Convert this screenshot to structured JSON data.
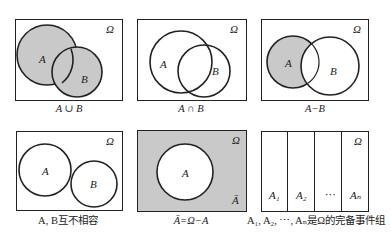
{
  "colors": {
    "fill": "#c9c9c9",
    "stroke": "#222222",
    "background": "#ffffff"
  },
  "panels": [
    {
      "id": "union",
      "caption": "A ∪ B",
      "omega": "Ω",
      "labels": {
        "a": "A",
        "b": "B"
      }
    },
    {
      "id": "intersection",
      "caption": "A ∩ B",
      "omega": "Ω",
      "labels": {
        "a": "A",
        "b": "B"
      }
    },
    {
      "id": "difference",
      "caption": "A−B",
      "omega": "Ω",
      "labels": {
        "a": "A",
        "b": "B"
      }
    },
    {
      "id": "mutually-exclusive",
      "caption": "A, B互不相容",
      "omega": "Ω",
      "labels": {
        "a": "A",
        "b": "B"
      }
    },
    {
      "id": "complement",
      "caption": "Ā=Ω−A",
      "omega": "Ω",
      "labels": {
        "a": "A",
        "abar": "Ā"
      }
    },
    {
      "id": "complete-event-group",
      "caption": "A₁, A₂, ⋯, Aₙ是Ω的完备事件组",
      "omega": "Ω",
      "labels": {
        "a1": "A₁",
        "a2": "A₂",
        "dots": "⋯",
        "an": "Aₙ"
      }
    }
  ]
}
